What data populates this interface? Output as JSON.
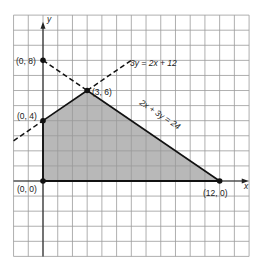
{
  "chart_data": {
    "type": "line",
    "title": "",
    "xlabel": "x",
    "ylabel": "y",
    "xlim": [
      -2,
      14
    ],
    "ylim": [
      -5,
      11
    ],
    "grid": true,
    "grid_step": 1,
    "feasible_region": {
      "vertices": [
        [
          0,
          0
        ],
        [
          0,
          4
        ],
        [
          3,
          6
        ],
        [
          12,
          0
        ]
      ],
      "fill": "#b8b8b8"
    },
    "lines": [
      {
        "name": "3y = 2x + 12",
        "slope": 0.6667,
        "intercept": 4,
        "style": "solid segment (0,4)-(3,6), dashed elsewhere"
      },
      {
        "name": "2x + 3y = 24",
        "slope": -0.6667,
        "intercept": 8,
        "style": "solid segment (3,6)-(12,0), dashed (0,8)-(3,6)"
      }
    ],
    "points": [
      {
        "label": "(0, 8)",
        "x": 0,
        "y": 8
      },
      {
        "label": "(0, 4)",
        "x": 0,
        "y": 4
      },
      {
        "label": "(3, 6)",
        "x": 3,
        "y": 6
      },
      {
        "label": "(0, 0)",
        "x": 0,
        "y": 0
      },
      {
        "label": "(12, 0)",
        "x": 12,
        "y": 0
      }
    ]
  },
  "labels": {
    "x_axis": "x",
    "y_axis": "y",
    "line1": "3y = 2x + 12",
    "line2": "2x + 3y = 24",
    "p08": "(0, 8)",
    "p04": "(0, 4)",
    "p36": "(3, 6)",
    "p00": "(0, 0)",
    "p120": "(12, 0)"
  },
  "colors": {
    "grid": "#9a9a9a",
    "axis": "#222222",
    "fill": "#b8b8b8",
    "line": "#111111"
  }
}
